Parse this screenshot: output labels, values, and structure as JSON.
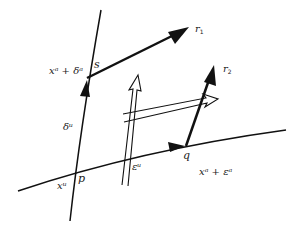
{
  "diagram": {
    "type": "geometric-vector-diagram",
    "colors": {
      "ink": "#111111",
      "background": "#ffffff"
    },
    "points": {
      "p": {
        "label": "p"
      },
      "q": {
        "label": "q"
      },
      "s": {
        "label": "s"
      }
    },
    "vectors": {
      "r1": {
        "label": "r",
        "subscript": "1"
      },
      "r2": {
        "label": "r",
        "subscript": "2"
      }
    },
    "labels": {
      "x_plus_delta": "xᵃ + δᵃ",
      "delta": "δᵘ",
      "epsilon": "εᵘ",
      "x": "xᵘ",
      "x_plus_epsilon": "xᵃ + εᵃ"
    },
    "curves": [
      {
        "name": "delta-curve",
        "description": "curve through p and s with arrow toward s"
      },
      {
        "name": "epsilon-curve",
        "description": "curve through p and q with arrow toward q"
      }
    ],
    "hollow_arrows": [
      {
        "name": "hollow-arrow-horizontal",
        "direction": "right"
      },
      {
        "name": "hollow-arrow-vertical",
        "direction": "up"
      }
    ]
  }
}
